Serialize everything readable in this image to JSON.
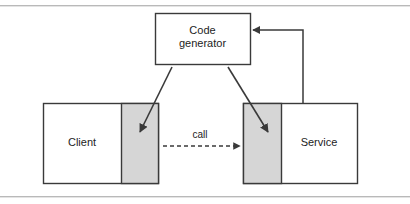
{
  "figure": {
    "kind": "software-architecture-diagram",
    "background": "#ffffff"
  },
  "colors": {
    "stroke": "#3a3a3a",
    "box_fill": "#ffffff",
    "generated_fill": "#d6d6d6",
    "text": "#1d1d1d",
    "rule": "#b9b9b9",
    "rule_shadow": "#e4e4e4"
  },
  "nodes": {
    "code_generator": {
      "label_line1": "Code",
      "label_line2": "generator",
      "x": 155,
      "y": 13,
      "width": 95,
      "height": 51,
      "fill": "#ffffff"
    },
    "client": {
      "label": "Client",
      "x": 43,
      "y": 103,
      "width": 115,
      "height": 80,
      "fill": "#ffffff",
      "stub": {
        "name": "client-stub",
        "x": 121,
        "y": 103,
        "width": 37,
        "height": 80,
        "fill": "#d6d6d6"
      }
    },
    "service": {
      "label": "Service",
      "x": 243,
      "y": 103,
      "width": 114,
      "height": 80,
      "fill": "#ffffff",
      "skeleton": {
        "name": "service-skeleton",
        "x": 243,
        "y": 103,
        "width": 38,
        "height": 80,
        "fill": "#d6d6d6"
      }
    }
  },
  "edges": {
    "generate_client_stub": {
      "name": "generate-client-stub-arrow",
      "style": "solid",
      "from": "code-generator",
      "to": "client-stub",
      "x1": 172,
      "y1": 67,
      "x2": 140,
      "y2": 132
    },
    "generate_service_skeleton": {
      "name": "generate-service-skeleton-arrow",
      "style": "solid",
      "from": "code-generator",
      "to": "service-skeleton",
      "x1": 228,
      "y1": 67,
      "x2": 268,
      "y2": 132
    },
    "call": {
      "name": "call-arrow",
      "label": "call",
      "style": "dashed",
      "from": "client-stub",
      "to": "service-skeleton",
      "x1": 163,
      "y1": 146,
      "x2": 241,
      "y2": 146
    },
    "interface_feedback": {
      "name": "interface-feedback-arrow",
      "style": "solid-elbow",
      "from": "service",
      "to": "code-generator",
      "points": "303,103 303,30 252,30"
    }
  }
}
